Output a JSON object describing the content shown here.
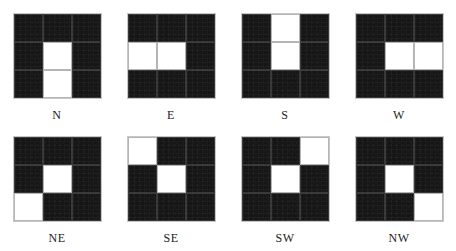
{
  "figure": {
    "title": "",
    "colors": {
      "dark_cell": "#151515",
      "light_cell": "#ffffff",
      "background": "#ffffff",
      "grid_line": "#787878",
      "label_text": "#1b1b1b"
    }
  },
  "chart_data": {
    "type": "heatmap",
    "title": "",
    "xlabel": "",
    "ylabel": "",
    "grid_size": [
      3,
      3
    ],
    "value_legend": {
      "0": "dark",
      "1": "light"
    },
    "layout": {
      "rows": 2,
      "columns": 4,
      "label_position": "below"
    },
    "panels": [
      {
        "label": "N",
        "values": [
          [
            0,
            0,
            0
          ],
          [
            0,
            1,
            0
          ],
          [
            0,
            1,
            0
          ]
        ]
      },
      {
        "label": "E",
        "values": [
          [
            0,
            0,
            0
          ],
          [
            1,
            1,
            0
          ],
          [
            0,
            0,
            0
          ]
        ]
      },
      {
        "label": "S",
        "values": [
          [
            0,
            1,
            0
          ],
          [
            0,
            1,
            0
          ],
          [
            0,
            0,
            0
          ]
        ]
      },
      {
        "label": "W",
        "values": [
          [
            0,
            0,
            0
          ],
          [
            0,
            1,
            1
          ],
          [
            0,
            0,
            0
          ]
        ]
      },
      {
        "label": "NE",
        "values": [
          [
            0,
            0,
            0
          ],
          [
            0,
            1,
            0
          ],
          [
            1,
            0,
            0
          ]
        ]
      },
      {
        "label": "SE",
        "values": [
          [
            1,
            0,
            0
          ],
          [
            0,
            1,
            0
          ],
          [
            0,
            0,
            0
          ]
        ]
      },
      {
        "label": "SW",
        "values": [
          [
            0,
            0,
            1
          ],
          [
            0,
            1,
            0
          ],
          [
            0,
            0,
            0
          ]
        ]
      },
      {
        "label": "NW",
        "values": [
          [
            0,
            0,
            0
          ],
          [
            0,
            1,
            0
          ],
          [
            0,
            0,
            1
          ]
        ]
      }
    ]
  }
}
